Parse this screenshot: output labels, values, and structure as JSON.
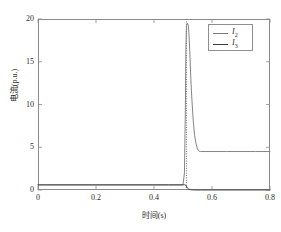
{
  "chart_data": {
    "type": "line",
    "title": "",
    "xlabel": "时间(s)",
    "ylabel": "电流(p.u.)",
    "xlim": [
      0,
      0.8
    ],
    "ylim": [
      0,
      20
    ],
    "xticks": [
      "0",
      "0.2",
      "0.4",
      "0.6",
      "0.8"
    ],
    "xtick_values": [
      0,
      0.2,
      0.4,
      0.6,
      0.8
    ],
    "yticks": [
      "0",
      "5",
      "10",
      "15",
      "20"
    ],
    "ytick_values": [
      0,
      5,
      10,
      15,
      20
    ],
    "grid": false,
    "legend_position": "upper right",
    "series": [
      {
        "name": "I2",
        "label": "I",
        "sub": "2",
        "color": "#777777",
        "style": "solid",
        "x": [
          0,
          0.1,
          0.2,
          0.3,
          0.4,
          0.45,
          0.5,
          0.505,
          0.508,
          0.51,
          0.512,
          0.515,
          0.518,
          0.52,
          0.523,
          0.527,
          0.53,
          0.535,
          0.54,
          0.545,
          0.55,
          0.555,
          0.56,
          0.6,
          0.65,
          0.7,
          0.75,
          0.8
        ],
        "y": [
          0.6,
          0.6,
          0.6,
          0.6,
          0.6,
          0.6,
          0.6,
          2.0,
          9.0,
          16.5,
          19.2,
          19.5,
          19.3,
          18.6,
          16.5,
          13.0,
          11.0,
          8.2,
          6.4,
          5.4,
          4.8,
          4.55,
          4.5,
          4.5,
          4.5,
          4.5,
          4.5,
          4.5
        ]
      },
      {
        "name": "I3",
        "label": "I",
        "sub": "3",
        "color": "#3a3a3a",
        "style": "dotted-vertical",
        "x": [
          0,
          0.1,
          0.2,
          0.3,
          0.4,
          0.45,
          0.5,
          0.505,
          0.51,
          0.513,
          0.516,
          0.52,
          0.525,
          0.53,
          0.54,
          0.56,
          0.6,
          0.7,
          0.8
        ],
        "y": [
          0.6,
          0.6,
          0.6,
          0.6,
          0.6,
          0.6,
          0.6,
          0.62,
          0.55,
          0.35,
          0.2,
          0.1,
          0.05,
          0.02,
          0.0,
          0.0,
          0.0,
          0.0,
          0.0
        ]
      }
    ],
    "annotations": [
      {
        "name": "fault-instant-dotted-line",
        "x": 0.512,
        "y_from": 0.0,
        "y_to": 20.0
      }
    ]
  }
}
